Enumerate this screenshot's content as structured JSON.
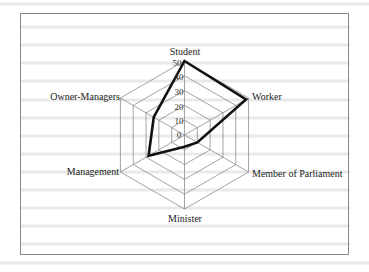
{
  "chart_data": {
    "type": "radar",
    "title": "",
    "categories": [
      "Student",
      "Worker",
      "Member of Parliament",
      "Minister",
      "Management",
      "Owner-Managers"
    ],
    "series": [
      {
        "name": "Series 1",
        "values": [
          50,
          48,
          10,
          8,
          28,
          24
        ],
        "color": "#111111"
      }
    ],
    "radial_ticks": [
      "0",
      "10",
      "20",
      "30",
      "40",
      "50"
    ],
    "rlim": [
      0,
      50
    ],
    "grid": true,
    "legend": "none"
  },
  "labels": {
    "student": "Student",
    "worker": "Worker",
    "mp": "Member of Parliament",
    "minister": "Minister",
    "management": "Management",
    "owner": "Owner-Managers"
  },
  "ticks": {
    "t0": "0",
    "t10": "10",
    "t20": "20",
    "t30": "30",
    "t40": "40",
    "t50": "50"
  }
}
